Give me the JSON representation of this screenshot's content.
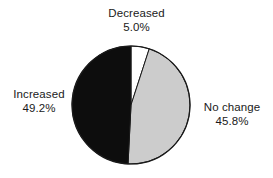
{
  "chart_data": {
    "type": "pie",
    "title": "",
    "subtitle": "",
    "xlabel": "",
    "ylabel": "",
    "legend_position": "none",
    "grid": false,
    "start_angle_deg": 0,
    "direction": "clockwise",
    "categories": [
      "Decreased",
      "No change",
      "Increased"
    ],
    "values": [
      5.0,
      45.8,
      49.2
    ],
    "value_suffix": "%",
    "slices": [
      {
        "label": "Decreased",
        "value": 5.0,
        "value_text": "5.0%",
        "color": "#ffffff",
        "edge_color": "#1a1a1a",
        "label_position": "top"
      },
      {
        "label": "No change",
        "value": 45.8,
        "value_text": "45.8%",
        "color": "#cccccc",
        "edge_color": "#1a1a1a",
        "label_position": "right"
      },
      {
        "label": "Increased",
        "value": 49.2,
        "value_text": "49.2%",
        "color": "#0d0d0d",
        "edge_color": "#1a1a1a",
        "label_position": "left"
      }
    ],
    "geometry": {
      "center_x": 131,
      "center_y": 105,
      "radius": 59
    },
    "colors": {
      "background": "#ffffff",
      "text": "#1a1a1a",
      "outline": "#1a1a1a"
    }
  }
}
